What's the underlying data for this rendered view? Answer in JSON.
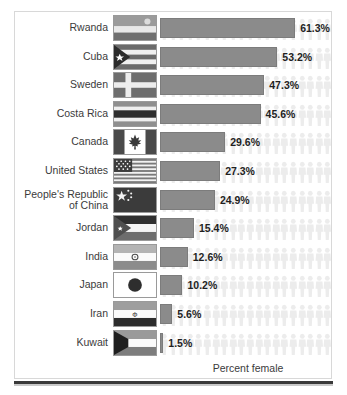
{
  "chart_data": {
    "type": "bar",
    "orientation": "horizontal",
    "title": "",
    "xlabel": "Percent female",
    "ylabel": "",
    "xlim": [
      0,
      70
    ],
    "grid": false,
    "legend": false,
    "categories": [
      "Rwanda",
      "Cuba",
      "Sweden",
      "Costa Rica",
      "Canada",
      "United States",
      "People's Republic\nof China",
      "Jordan",
      "India",
      "Japan",
      "Iran",
      "Kuwait"
    ],
    "values": [
      61.3,
      53.2,
      47.3,
      45.6,
      29.6,
      27.3,
      24.9,
      15.4,
      12.6,
      10.2,
      5.6,
      1.5
    ],
    "value_labels": [
      "61.3%",
      "53.2%",
      "47.3%",
      "45.6%",
      "29.6%",
      "27.3%",
      "24.9%",
      "15.4%",
      "12.6%",
      "10.2%",
      "5.6%",
      "1.5%"
    ],
    "bar_color": "#8b8b8b",
    "background_pattern": "human-figure-silhouettes",
    "background_pattern_color": "#ececec"
  },
  "rows": [
    {
      "country": "Rwanda",
      "flag": "flag-rwanda",
      "value": 61.3,
      "label": "61.3%"
    },
    {
      "country": "Cuba",
      "flag": "flag-cuba",
      "value": 53.2,
      "label": "53.2%"
    },
    {
      "country": "Sweden",
      "flag": "flag-sweden",
      "value": 47.3,
      "label": "47.3%"
    },
    {
      "country": "Costa Rica",
      "flag": "flag-costa-rica",
      "value": 45.6,
      "label": "45.6%"
    },
    {
      "country": "Canada",
      "flag": "flag-canada",
      "value": 29.6,
      "label": "29.6%"
    },
    {
      "country": "United States",
      "flag": "flag-united-states",
      "value": 27.3,
      "label": "27.3%"
    },
    {
      "country": "People's Republic\nof China",
      "flag": "flag-china",
      "value": 24.9,
      "label": "24.9%"
    },
    {
      "country": "Jordan",
      "flag": "flag-jordan",
      "value": 15.4,
      "label": "15.4%"
    },
    {
      "country": "India",
      "flag": "flag-india",
      "value": 12.6,
      "label": "12.6%"
    },
    {
      "country": "Japan",
      "flag": "flag-japan",
      "value": 10.2,
      "label": "10.2%"
    },
    {
      "country": "Iran",
      "flag": "flag-iran",
      "value": 5.6,
      "label": "5.6%"
    },
    {
      "country": "Kuwait",
      "flag": "flag-kuwait",
      "value": 1.5,
      "label": "1.5%"
    }
  ],
  "axis": {
    "caption": "Percent female"
  },
  "colors": {
    "bar": "#8b8b8b",
    "bar_border": "#7c7c7c",
    "text": "#3b3b3b",
    "value_text": "#1f1f1f",
    "pattern": "#ececec",
    "frame_border": "#d8d8d8",
    "rule": "#3a3a3a"
  }
}
